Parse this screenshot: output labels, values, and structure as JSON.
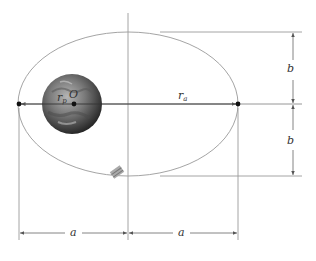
{
  "diagram": {
    "labels": {
      "perigee_radius": "r",
      "perigee_sub": "p",
      "focus": "O",
      "apogee_radius": "r",
      "apogee_sub": "a",
      "semi_minor_top": "b",
      "semi_minor_bottom": "b",
      "semi_major_left": "a",
      "semi_major_right": "a"
    },
    "colors": {
      "line": "#8a8a8a",
      "text": "#333333",
      "planet_dark": "#2a2a2a",
      "planet_light": "#9a9a9a"
    }
  }
}
